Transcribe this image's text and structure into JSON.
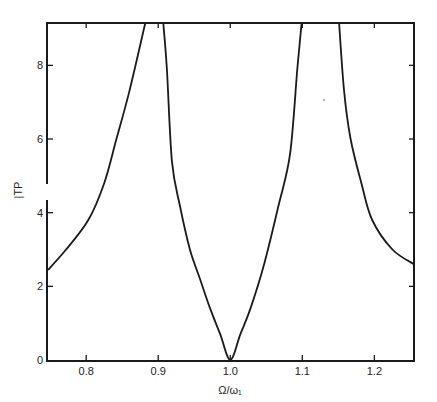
{
  "chart_data": {
    "type": "line",
    "title": "",
    "xlabel": "Ω/ω₁",
    "ylabel": "|TP",
    "xlim": [
      0.747,
      1.255
    ],
    "ylim": [
      0,
      9.15
    ],
    "grid": false,
    "legend": null,
    "x_ticks": [
      0.8,
      0.9,
      1.0,
      1.1,
      1.2
    ],
    "x_tick_labels": [
      "0.8",
      "0.9",
      "1.0",
      "1.1",
      "1.2"
    ],
    "y_ticks": [
      0,
      2,
      4,
      6,
      8
    ],
    "y_tick_labels": [
      "0",
      "2",
      "4",
      "6",
      "8"
    ],
    "series": [
      {
        "name": "left-branch",
        "x": [
          0.747,
          0.77,
          0.803,
          0.825,
          0.842,
          0.86,
          0.882
        ],
        "y": [
          2.45,
          2.95,
          3.8,
          4.8,
          6.0,
          7.3,
          9.15
        ]
      },
      {
        "name": "middle-branch",
        "x": [
          0.907,
          0.912,
          0.919,
          0.93,
          0.944,
          0.958,
          0.972,
          0.986,
          1.0,
          1.014,
          1.028,
          1.047,
          1.067,
          1.083,
          1.093,
          1.099
        ],
        "y": [
          9.15,
          7.9,
          5.4,
          4.2,
          3.0,
          2.2,
          1.4,
          0.7,
          0.0,
          0.7,
          1.4,
          2.6,
          4.2,
          5.6,
          7.9,
          9.15
        ]
      },
      {
        "name": "right-branch",
        "x": [
          1.151,
          1.158,
          1.167,
          1.182,
          1.197,
          1.225,
          1.255
        ],
        "y": [
          9.15,
          7.3,
          6.0,
          4.8,
          3.8,
          3.0,
          2.6
        ]
      }
    ]
  }
}
